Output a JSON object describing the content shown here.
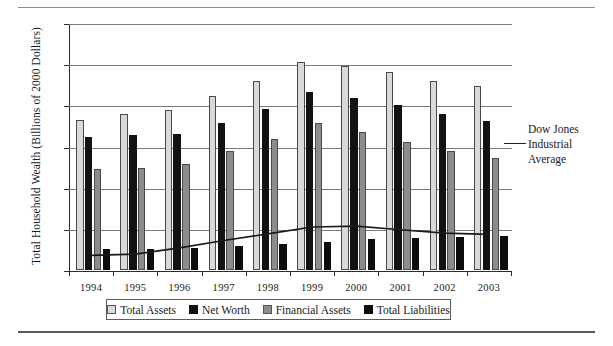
{
  "chart_data": {
    "type": "bar",
    "title": "",
    "xlabel": "",
    "ylabel": "Total Household Wealth (Billions of 2000 Dollars)",
    "categories": [
      "1994",
      "1995",
      "1996",
      "1997",
      "1998",
      "1999",
      "2000",
      "2001",
      "2002",
      "2003"
    ],
    "ylim": [
      0,
      60000
    ],
    "yticks": [
      0,
      10000,
      20000,
      30000,
      40000,
      50000,
      60000
    ],
    "ytick_labels": [
      "0",
      "10000",
      "20000",
      "30000",
      "40000",
      "50000",
      "60000"
    ],
    "grid": true,
    "legend_position": "bottom",
    "series": [
      {
        "name": "Total Assets",
        "color": "#d9d9d9",
        "values": [
          36500,
          38000,
          38800,
          42300,
          46000,
          50600,
          49500,
          48000,
          46000,
          44700
        ]
      },
      {
        "name": "Net Worth",
        "color": "#121212",
        "values": [
          32200,
          32700,
          33000,
          35800,
          39000,
          43300,
          41900,
          40000,
          38000,
          36200
        ]
      },
      {
        "name": "Financial Assets",
        "color": "#8c8c8c",
        "values": [
          24600,
          24800,
          25800,
          29000,
          31800,
          35700,
          33600,
          31200,
          29000,
          27300
        ]
      },
      {
        "name": "Total Liabilities",
        "color": "#0d0d0d",
        "values": [
          5000,
          5200,
          5400,
          5800,
          6300,
          6900,
          7500,
          7700,
          7900,
          8300
        ]
      }
    ],
    "overlay_line": {
      "name": "Dow Jones Industrial Average",
      "color": "#1a1a1a",
      "values": [
        3800,
        4100,
        5600,
        7400,
        9000,
        10700,
        10900,
        10000,
        9200,
        8900
      ]
    },
    "annotation": {
      "line1": "Dow Jones",
      "line2": "Industrial",
      "line3": "Average"
    }
  }
}
